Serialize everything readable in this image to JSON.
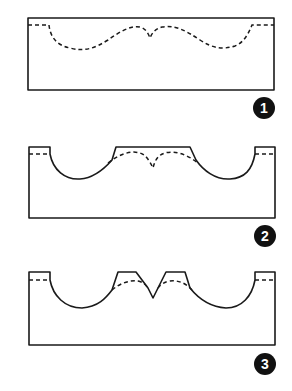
{
  "figure": {
    "colors": {
      "line": "#1a1a1a",
      "badge_fill": "#111111",
      "badge_text": "#ffffff",
      "background": "#ffffff"
    },
    "steps": [
      {
        "number": "1",
        "label": "Step 1: dashed profile marked on block"
      },
      {
        "number": "2",
        "label": "Step 2: two outer hollows cut out"
      },
      {
        "number": "3",
        "label": "Step 3: center notch cut, leaving two bumps"
      }
    ]
  }
}
